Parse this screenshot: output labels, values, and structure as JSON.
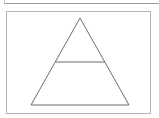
{
  "diagram": {
    "type": "pyramid",
    "levels": 2,
    "stroke_color": "#6e6e6e",
    "frame_color": "#b4b4b4",
    "shape": {
      "apex": [
        80,
        18
      ],
      "base_left": [
        31,
        105
      ],
      "base_right": [
        129,
        105
      ],
      "divider": {
        "y": 62,
        "x1": 56,
        "x2": 105
      }
    }
  }
}
